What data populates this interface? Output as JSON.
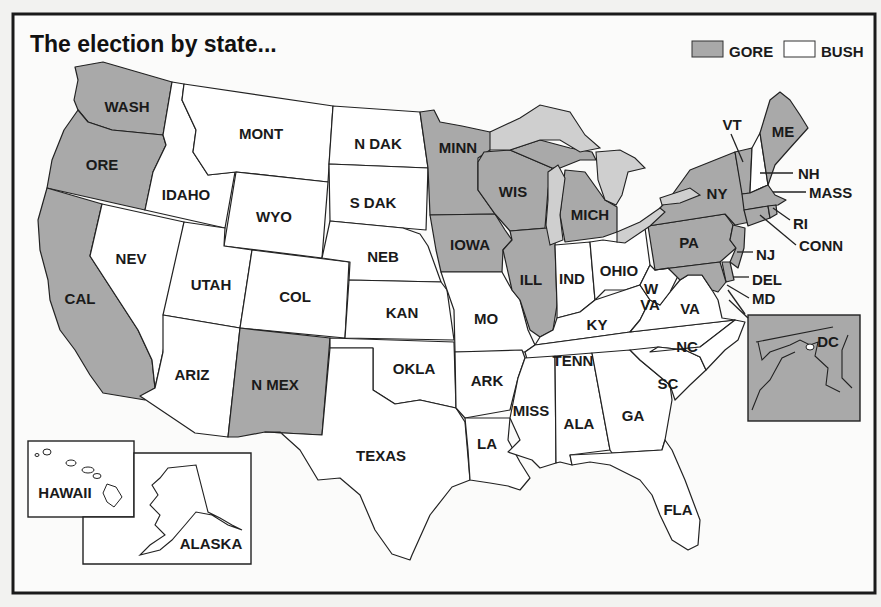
{
  "title": "The election by state...",
  "legend": {
    "items": [
      {
        "label": "GORE",
        "color": "#a9a9a9"
      },
      {
        "label": "BUSH",
        "color": "#ffffff"
      }
    ]
  },
  "colors": {
    "gore": "#a9a9a9",
    "bush": "#ffffff",
    "lakes": "#cfcfcf",
    "border": "#1a1a1a"
  },
  "states": {
    "WASH": {
      "label": "WASH",
      "winner": "GORE"
    },
    "ORE": {
      "label": "ORE",
      "winner": "GORE"
    },
    "CAL": {
      "label": "CAL",
      "winner": "GORE"
    },
    "IDAHO": {
      "label": "IDAHO",
      "winner": "BUSH"
    },
    "NEV": {
      "label": "NEV",
      "winner": "BUSH"
    },
    "MONT": {
      "label": "MONT",
      "winner": "BUSH"
    },
    "WYO": {
      "label": "WYO",
      "winner": "BUSH"
    },
    "UTAH": {
      "label": "UTAH",
      "winner": "BUSH"
    },
    "COL": {
      "label": "COL",
      "winner": "BUSH"
    },
    "ARIZ": {
      "label": "ARIZ",
      "winner": "BUSH"
    },
    "N_MEX": {
      "label": "N MEX",
      "winner": "GORE"
    },
    "N_DAK": {
      "label": "N DAK",
      "winner": "BUSH"
    },
    "S_DAK": {
      "label": "S DAK",
      "winner": "BUSH"
    },
    "NEB": {
      "label": "NEB",
      "winner": "BUSH"
    },
    "KAN": {
      "label": "KAN",
      "winner": "BUSH"
    },
    "OKLA": {
      "label": "OKLA",
      "winner": "BUSH"
    },
    "TEXAS": {
      "label": "TEXAS",
      "winner": "BUSH"
    },
    "MINN": {
      "label": "MINN",
      "winner": "GORE"
    },
    "IOWA": {
      "label": "IOWA",
      "winner": "GORE"
    },
    "MO": {
      "label": "MO",
      "winner": "BUSH"
    },
    "ARK": {
      "label": "ARK",
      "winner": "BUSH"
    },
    "LA": {
      "label": "LA",
      "winner": "BUSH"
    },
    "WIS": {
      "label": "WIS",
      "winner": "GORE"
    },
    "ILL": {
      "label": "ILL",
      "winner": "GORE"
    },
    "MICH": {
      "label": "MICH",
      "winner": "GORE"
    },
    "IND": {
      "label": "IND",
      "winner": "BUSH"
    },
    "OHIO": {
      "label": "OHIO",
      "winner": "BUSH"
    },
    "KY": {
      "label": "KY",
      "winner": "BUSH"
    },
    "TENN": {
      "label": "TENN",
      "winner": "BUSH"
    },
    "MISS": {
      "label": "MISS",
      "winner": "BUSH"
    },
    "ALA": {
      "label": "ALA",
      "winner": "BUSH"
    },
    "GA": {
      "label": "GA",
      "winner": "BUSH"
    },
    "FLA": {
      "label": "FLA",
      "winner": "BUSH"
    },
    "SC": {
      "label": "SC",
      "winner": "BUSH"
    },
    "NC": {
      "label": "NC",
      "winner": "BUSH"
    },
    "VA": {
      "label": "VA",
      "winner": "BUSH"
    },
    "W_VA": {
      "label": "W VA",
      "label_line1": "W",
      "label_line2": "VA",
      "winner": "BUSH"
    },
    "PA": {
      "label": "PA",
      "winner": "GORE"
    },
    "NY": {
      "label": "NY",
      "winner": "GORE"
    },
    "VT": {
      "label": "VT",
      "winner": "GORE"
    },
    "NH": {
      "label": "NH",
      "winner": "BUSH"
    },
    "ME": {
      "label": "ME",
      "winner": "GORE"
    },
    "MASS": {
      "label": "MASS",
      "winner": "GORE"
    },
    "RI": {
      "label": "RI",
      "winner": "GORE"
    },
    "CONN": {
      "label": "CONN",
      "winner": "GORE"
    },
    "NJ": {
      "label": "NJ",
      "winner": "GORE"
    },
    "DEL": {
      "label": "DEL",
      "winner": "GORE"
    },
    "MD": {
      "label": "MD",
      "winner": "GORE"
    },
    "DC": {
      "label": "DC",
      "winner": "GORE"
    },
    "HAWAII": {
      "label": "HAWAII",
      "winner": "GORE"
    },
    "ALASKA": {
      "label": "ALASKA",
      "winner": "BUSH"
    }
  }
}
